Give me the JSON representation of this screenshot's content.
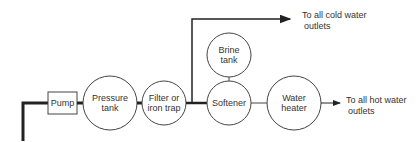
{
  "diagram": {
    "title": "",
    "nodes": [
      {
        "id": "pump",
        "label": "Pump",
        "shape": "rectangle"
      },
      {
        "id": "pressure_tank",
        "label_line1": "Pressure",
        "label_line2": "tank",
        "shape": "circle"
      },
      {
        "id": "filter",
        "label_line1": "Filter or",
        "label_line2": "iron trap",
        "shape": "circle"
      },
      {
        "id": "brine_tank",
        "label_line1": "Brine",
        "label_line2": "tank",
        "shape": "circle"
      },
      {
        "id": "softener",
        "label": "Softener",
        "shape": "circle"
      },
      {
        "id": "water_heater",
        "label_line1": "Water",
        "label_line2": "heater",
        "shape": "circle"
      }
    ],
    "outputs": {
      "cold_line1": "To all cold water",
      "cold_line2": "outlets",
      "hot_line1": "To all hot water",
      "hot_line2": "outlets"
    },
    "edges": [
      [
        "supply",
        "pump"
      ],
      [
        "pump",
        "pressure_tank"
      ],
      [
        "pressure_tank",
        "filter"
      ],
      [
        "filter",
        "softener"
      ],
      [
        "filter",
        "cold_outlets"
      ],
      [
        "brine_tank",
        "softener"
      ],
      [
        "softener",
        "water_heater"
      ],
      [
        "water_heater",
        "hot_outlets"
      ]
    ],
    "colors": {
      "line": "#222222",
      "background": "#ffffff"
    }
  }
}
